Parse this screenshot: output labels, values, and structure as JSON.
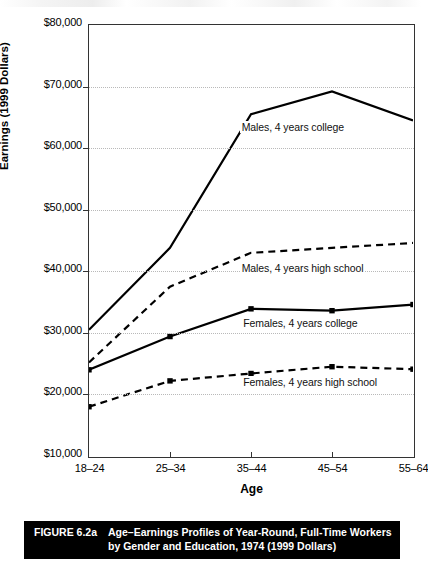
{
  "figure": {
    "number_label": "FIGURE 6.2a",
    "caption_line1": "Age–Earnings Profiles of Year-Round, Full-Time Workers",
    "caption_line2": "by Gender and Education, 1974 (1999 Dollars)"
  },
  "chart_data": {
    "type": "line",
    "title": "",
    "xlabel": "Age",
    "ylabel": "Earnings (1999 Dollars)",
    "categories": [
      "18–24",
      "25–34",
      "35–44",
      "45–54",
      "55–64"
    ],
    "ylim": [
      10000,
      80000
    ],
    "ytick_values": [
      10000,
      20000,
      30000,
      40000,
      50000,
      60000,
      70000,
      80000
    ],
    "ytick_labels": [
      "$10,000",
      "$20,000",
      "$30,000",
      "$40,000",
      "$50,000",
      "$60,000",
      "$70,000",
      "$80,000"
    ],
    "grid": true,
    "legend": "inline-annotations",
    "series": [
      {
        "name": "Males, 4 years college",
        "style": "solid",
        "markers": false,
        "color": "#000000",
        "values": [
          30500,
          43800,
          65500,
          69200,
          64500
        ]
      },
      {
        "name": "Males, 4 years high school",
        "style": "dashed",
        "markers": false,
        "color": "#000000",
        "values": [
          25200,
          37500,
          43000,
          43800,
          44600
        ]
      },
      {
        "name": "Females, 4 years college",
        "style": "solid",
        "markers": true,
        "color": "#000000",
        "values": [
          24000,
          29400,
          33900,
          33600,
          34600
        ]
      },
      {
        "name": "Females, 4 years high school",
        "style": "dashed",
        "markers": true,
        "color": "#000000",
        "values": [
          18000,
          22200,
          23400,
          24500,
          24100
        ]
      }
    ],
    "annotations": [
      {
        "text": "Males, 4 years college",
        "x_frac": 0.465,
        "value": 63200
      },
      {
        "text": "Males, 4 years high school",
        "x_frac": 0.465,
        "value": 40400
      },
      {
        "text": "Females, 4 years college",
        "x_frac": 0.47,
        "value": 31400
      },
      {
        "text": "Females, 4 years high school",
        "x_frac": 0.47,
        "value": 21900
      }
    ]
  }
}
